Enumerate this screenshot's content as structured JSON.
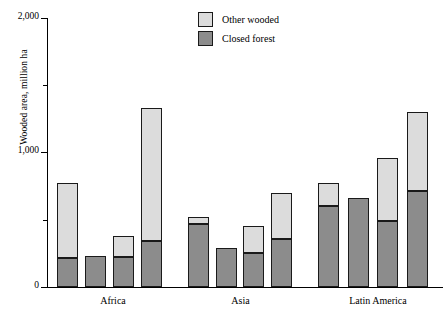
{
  "chart_data": {
    "type": "bar",
    "subtype": "stacked-bar-grouped",
    "title": "",
    "xlabel": "",
    "ylabel": "Wooded area, million ha",
    "ylim": [
      0,
      2000
    ],
    "yticks": [
      0,
      1000,
      2000
    ],
    "ytick_labels": [
      "0",
      "1,000",
      "2,000"
    ],
    "yminor_ticks": [
      500,
      1500
    ],
    "grid": false,
    "legend_position": "top-center",
    "categories": [
      "Africa",
      "Asia",
      "Latin America"
    ],
    "bars_per_category": 4,
    "series": [
      {
        "name": "Closed forest",
        "color": "#8c8c8c",
        "values": [
          [
            216,
            230,
            222,
            340
          ],
          [
            468,
            290,
            250,
            360
          ],
          [
            600,
            660,
            490,
            710
          ]
        ]
      },
      {
        "name": "Other wooded",
        "color": "#dcdcdc",
        "values": [
          [
            557,
            0,
            158,
            990
          ],
          [
            52,
            0,
            200,
            340
          ],
          [
            170,
            0,
            470,
            590
          ]
        ]
      }
    ],
    "totals": [
      [
        773,
        230,
        380,
        1330
      ],
      [
        520,
        290,
        450,
        700
      ],
      [
        770,
        660,
        960,
        1300
      ]
    ]
  },
  "legend": {
    "items": [
      {
        "label": "Other wooded",
        "swatch": "light"
      },
      {
        "label": "Closed forest",
        "swatch": "dark"
      }
    ]
  },
  "axis": {
    "y_title": "Wooded area, million ha",
    "y_labels": [
      "2,000",
      "1,000",
      "0"
    ],
    "x_labels": [
      "Africa",
      "Asia",
      "Latin America"
    ]
  },
  "colors": {
    "other_wooded": "#dcdcdc",
    "closed_forest": "#8c8c8c",
    "axis": "#000000",
    "bar_outline": "#1a1a1a",
    "background": "#ffffff"
  }
}
